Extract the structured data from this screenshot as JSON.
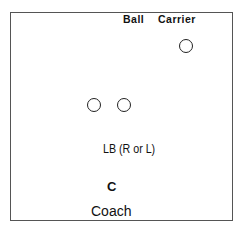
{
  "diagram": {
    "labels": {
      "ball": "Ball",
      "carrier": "Carrier",
      "linebacker": "LB (R or L)",
      "coach_marker": "C",
      "coach": "Coach"
    },
    "players": [
      {
        "role": "ball-carrier",
        "x": 160,
        "y": 42
      },
      {
        "role": "player-left",
        "x": 88,
        "y": 99
      },
      {
        "role": "player-right",
        "x": 118,
        "y": 99
      }
    ],
    "colors": {
      "border": "#555555",
      "stroke": "#222222",
      "text": "#111111",
      "background": "#ffffff"
    }
  }
}
